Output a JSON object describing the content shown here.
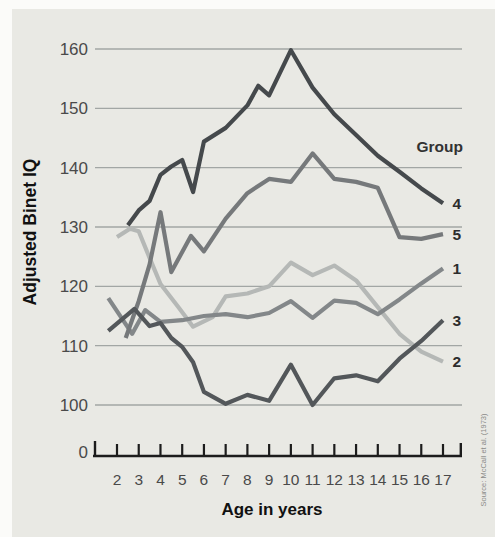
{
  "figure": {
    "panel_color": "#e9e9e4",
    "page_background": "#fbfbf9",
    "source_note": "Source: McCall et al. (1973)",
    "text_color": "#3c3c3c",
    "tick_label_color": "#4a4a4a",
    "gridline_color": "#a2a6a4",
    "axis_color": "#1c1c1c"
  },
  "chart_data": {
    "type": "line",
    "title": "",
    "xlabel": "Age in years",
    "ylabel": "Adjusted Binet IQ",
    "legend_title": "Group",
    "origin_label": "0",
    "x_ticks": [
      2,
      3,
      4,
      5,
      6,
      7,
      8,
      9,
      10,
      11,
      12,
      13,
      14,
      15,
      16,
      17
    ],
    "y_ticks": [
      100,
      110,
      120,
      130,
      140,
      150,
      160
    ],
    "xlim": [
      2,
      17
    ],
    "ylim": [
      100,
      160
    ],
    "grid": true,
    "legend_position": "right-of-line-ends",
    "series": [
      {
        "name": "2",
        "color": "#b5b8b6",
        "points": [
          [
            2,
            128.3
          ],
          [
            2.6,
            129.7
          ],
          [
            3,
            129.3
          ],
          [
            3.5,
            124.8
          ],
          [
            4,
            120.4
          ],
          [
            4.8,
            116.6
          ],
          [
            5.5,
            113.2
          ],
          [
            6.4,
            114.8
          ],
          [
            7,
            118.3
          ],
          [
            8,
            118.8
          ],
          [
            9,
            120
          ],
          [
            10,
            124
          ],
          [
            11,
            121.9
          ],
          [
            12,
            123.5
          ],
          [
            13,
            121
          ],
          [
            14,
            116.5
          ],
          [
            15,
            112
          ],
          [
            16,
            109
          ],
          [
            17,
            107.3
          ]
        ]
      },
      {
        "name": "1",
        "color": "#838789",
        "points": [
          [
            1.6,
            118
          ],
          [
            2.7,
            112
          ],
          [
            3.3,
            116
          ],
          [
            4,
            114
          ],
          [
            5,
            114.3
          ],
          [
            6,
            115
          ],
          [
            7,
            115.3
          ],
          [
            8,
            114.8
          ],
          [
            9,
            115.5
          ],
          [
            10,
            117.5
          ],
          [
            11,
            114.7
          ],
          [
            12,
            117.6
          ],
          [
            13,
            117.2
          ],
          [
            14,
            115.3
          ],
          [
            15,
            117.8
          ],
          [
            16,
            120.5
          ],
          [
            17,
            123
          ]
        ]
      },
      {
        "name": "5",
        "color": "#76797b",
        "points": [
          [
            2.4,
            111.3
          ],
          [
            3,
            117.5
          ],
          [
            3.5,
            123.7
          ],
          [
            4,
            132.5
          ],
          [
            4.5,
            122.4
          ],
          [
            5.4,
            128.5
          ],
          [
            6,
            125.9
          ],
          [
            7,
            131.4
          ],
          [
            8,
            135.7
          ],
          [
            9,
            138.1
          ],
          [
            10,
            137.6
          ],
          [
            11,
            142.4
          ],
          [
            12,
            138.1
          ],
          [
            13,
            137.6
          ],
          [
            14,
            136.6
          ],
          [
            15,
            128.3
          ],
          [
            16,
            128
          ],
          [
            17,
            128.8
          ]
        ]
      },
      {
        "name": "3",
        "color": "#53575a",
        "points": [
          [
            1.6,
            112.5
          ],
          [
            2.8,
            116.2
          ],
          [
            3.5,
            113.3
          ],
          [
            4,
            113.8
          ],
          [
            4.5,
            111.3
          ],
          [
            5,
            109.8
          ],
          [
            5.5,
            107.2
          ],
          [
            6,
            102.2
          ],
          [
            7,
            100.2
          ],
          [
            8,
            101.7
          ],
          [
            9,
            100.7
          ],
          [
            10,
            106.8
          ],
          [
            11,
            100
          ],
          [
            12,
            104.5
          ],
          [
            13,
            105
          ],
          [
            14,
            104
          ],
          [
            15,
            107.8
          ],
          [
            16,
            110.8
          ],
          [
            17,
            114.3
          ]
        ]
      },
      {
        "name": "4",
        "color": "#45494c",
        "points": [
          [
            2.5,
            130.3
          ],
          [
            3,
            132.8
          ],
          [
            3.5,
            134.4
          ],
          [
            4,
            138.8
          ],
          [
            4.5,
            140.2
          ],
          [
            5,
            141.3
          ],
          [
            5.5,
            135.9
          ],
          [
            6,
            144.4
          ],
          [
            7,
            146.7
          ],
          [
            8,
            150.5
          ],
          [
            8.5,
            153.8
          ],
          [
            9,
            152.2
          ],
          [
            10,
            159.8
          ],
          [
            11,
            153.5
          ],
          [
            12,
            149
          ],
          [
            13,
            145.5
          ],
          [
            14,
            142
          ],
          [
            15,
            139.3
          ],
          [
            16,
            136.5
          ],
          [
            17,
            134
          ]
        ]
      }
    ]
  }
}
